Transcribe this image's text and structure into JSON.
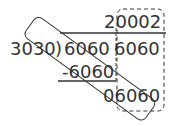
{
  "division": {
    "divisor": "3030",
    "bracket": ")",
    "dividend_left": "6060",
    "dividend_right": "6060",
    "quotient": "20002",
    "subtraction": "-6060",
    "remainder": "06060"
  },
  "annotations": {
    "diagonal_box": "rounded rectangle rotated enclosing 3030 through 06060",
    "dashed_box": "dashed rounded rectangle around last column"
  },
  "colors": {
    "ink": "#333333",
    "background": "#ffffff"
  }
}
